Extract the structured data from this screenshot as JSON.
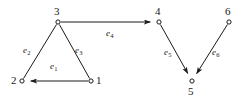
{
  "figure": {
    "kind": "directed-graph-diagram",
    "background_color": "#ffffff",
    "stroke_color": "#1a1a1a",
    "node_fill_color": "#ffffff",
    "width": 252,
    "height": 101
  },
  "nodes": [
    {
      "id": "1",
      "label": "1",
      "cx": 91,
      "cy": 81,
      "label_x": 96,
      "label_y": 75
    },
    {
      "id": "2",
      "label": "2",
      "cx": 22,
      "cy": 81,
      "label_x": 11,
      "label_y": 75
    },
    {
      "id": "3",
      "label": "3",
      "cx": 58,
      "cy": 22,
      "label_x": 54,
      "label_y": 6
    },
    {
      "id": "4",
      "label": "4",
      "cx": 159,
      "cy": 22,
      "label_x": 155,
      "label_y": 6
    },
    {
      "id": "5",
      "label": "5",
      "cx": 192,
      "cy": 81,
      "label_x": 188,
      "label_y": 86
    },
    {
      "id": "6",
      "label": "6",
      "cx": 229,
      "cy": 22,
      "label_x": 225,
      "label_y": 6
    }
  ],
  "edges": [
    {
      "id": "e1",
      "name": "e",
      "subscript": "1",
      "from": "1",
      "to": "2",
      "arrow_at": "to",
      "label_x": 50,
      "label_y": 62
    },
    {
      "id": "e2",
      "name": "e",
      "subscript": "2",
      "from": "3",
      "to": "2",
      "arrow_at": "none",
      "label_x": 23,
      "label_y": 46
    },
    {
      "id": "e3",
      "name": "e",
      "subscript": "3",
      "from": "3",
      "to": "1",
      "arrow_at": "none",
      "label_x": 75,
      "label_y": 46
    },
    {
      "id": "e4",
      "name": "e",
      "subscript": "4",
      "from": "3",
      "to": "4",
      "arrow_at": "to",
      "label_x": 106,
      "label_y": 29
    },
    {
      "id": "e5",
      "name": "e",
      "subscript": "5",
      "from": "4",
      "to": "5",
      "arrow_at": "to",
      "label_x": 164,
      "label_y": 48
    },
    {
      "id": "e6",
      "name": "e",
      "subscript": "6",
      "from": "6",
      "to": "5",
      "arrow_at": "to",
      "label_x": 212,
      "label_y": 48
    }
  ]
}
